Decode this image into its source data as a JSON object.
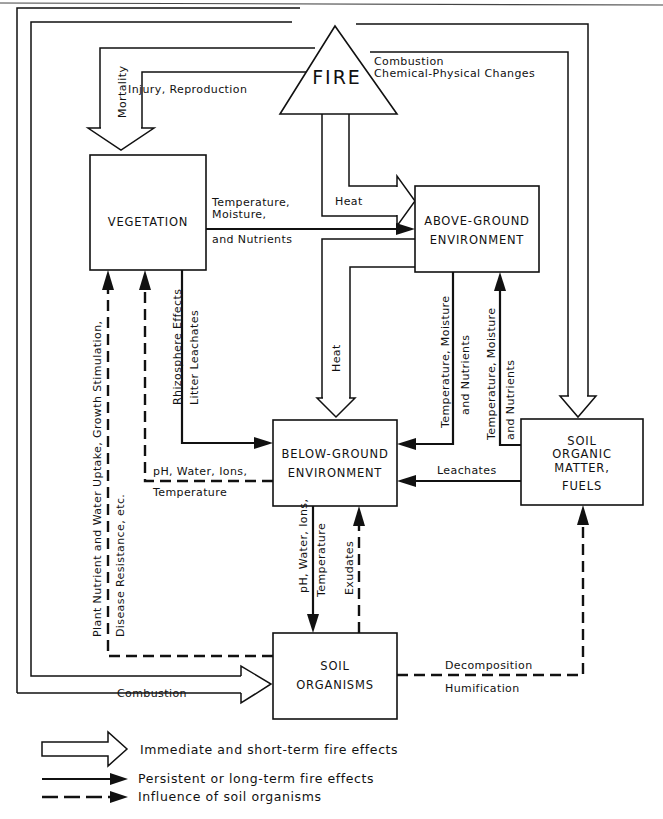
{
  "diagram": {
    "nodes": {
      "fire": "FIRE",
      "vegetation": "VEGETATION",
      "above_ground": [
        "ABOVE-GROUND",
        "ENVIRONMENT"
      ],
      "below_ground": [
        "BELOW-GROUND",
        "ENVIRONMENT"
      ],
      "soil_organic": [
        "SOIL",
        "ORGANIC",
        "MATTER,",
        "FUELS"
      ],
      "soil_organisms": [
        "SOIL",
        "ORGANISMS"
      ]
    },
    "edges": {
      "fire_to_vegetation": [
        "Injury, Reproduction",
        "Mortality"
      ],
      "fire_to_soil_organic": [
        "Combustion",
        "Chemical-Physical Changes"
      ],
      "fire_to_above_ground": "Heat",
      "vegetation_to_above_ground": [
        "Temperature,",
        "Moisture,",
        "and Nutrients"
      ],
      "above_ground_to_below_ground": "Heat",
      "above_to_below_persistent": [
        "Temperature, Moisture",
        "and Nutrients"
      ],
      "soil_organic_to_above_ground": [
        "Temperature, Moisture",
        "and Nutrients"
      ],
      "vegetation_to_below_ground": [
        "Rhizosphere Effects",
        "Litter Leachates"
      ],
      "below_ground_to_vegetation": [
        "pH, Water, Ions,",
        "Temperature"
      ],
      "soil_organic_to_below_ground": "Leachates",
      "below_ground_to_soil_organisms": [
        "pH, Water, Ions,",
        "Temperature"
      ],
      "soil_organisms_to_below_ground": "Exudates",
      "soil_organisms_to_vegetation": [
        "Plant Nutrient and Water Uptake, Growth Stimulation,",
        "Disease Resistance, etc."
      ],
      "soil_organisms_to_soil_organic": [
        "Decomposition",
        "Humification"
      ],
      "fire_to_soil_organisms": "Combustion"
    },
    "legend": [
      {
        "type": "hollow-arrow",
        "label": "Immediate and short-term fire effects"
      },
      {
        "type": "solid-arrow",
        "label": "Persistent or long-term fire effects"
      },
      {
        "type": "dashed-arrow",
        "label": "Influence of soil organisms"
      }
    ]
  }
}
